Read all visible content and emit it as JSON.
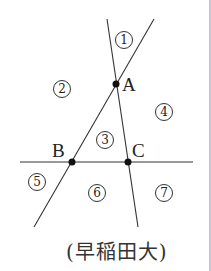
{
  "diagram": {
    "lines": [
      {
        "name": "line-AC",
        "x1": 107,
        "y1": 19,
        "x2": 138,
        "y2": 227
      },
      {
        "name": "line-AB",
        "x1": 154,
        "y1": 19,
        "x2": 34,
        "y2": 227
      },
      {
        "name": "line-BC",
        "x1": 20,
        "y1": 162,
        "x2": 193,
        "y2": 162
      }
    ],
    "points": [
      {
        "label": "A",
        "x": 116,
        "y": 84
      },
      {
        "label": "B",
        "x": 72,
        "y": 162
      },
      {
        "label": "C",
        "x": 128,
        "y": 162
      }
    ],
    "regions": [
      {
        "label": "①",
        "x": 124,
        "y": 40
      },
      {
        "label": "②",
        "x": 62,
        "y": 89
      },
      {
        "label": "③",
        "x": 105,
        "y": 140
      },
      {
        "label": "④",
        "x": 164,
        "y": 112
      },
      {
        "label": "⑤",
        "x": 37,
        "y": 182
      },
      {
        "label": "⑥",
        "x": 97,
        "y": 193
      },
      {
        "label": "⑦",
        "x": 164,
        "y": 193
      }
    ],
    "line_color": "#333333",
    "point_color": "#111111"
  },
  "source": "(早稲田大)"
}
